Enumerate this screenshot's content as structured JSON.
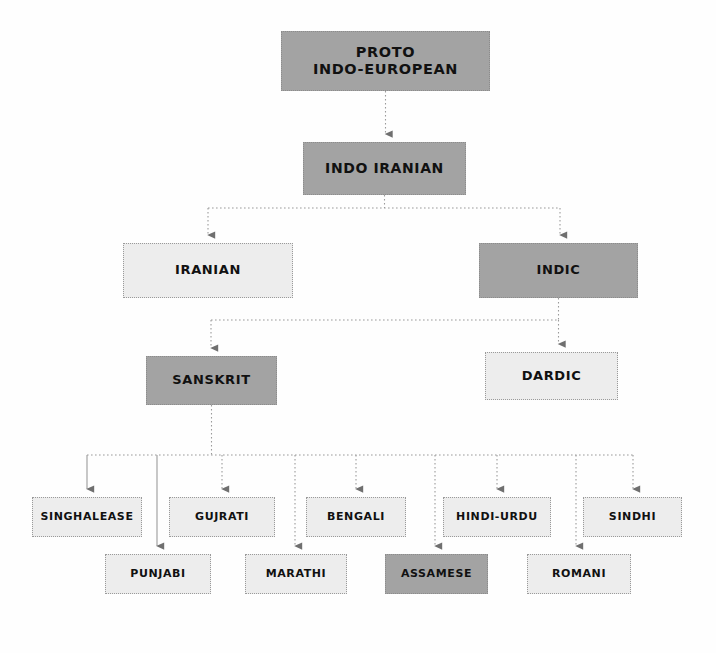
{
  "diagram": {
    "type": "tree-diagram",
    "background_color": "#fefefe",
    "colors": {
      "node_dark": "#a3a3a3",
      "node_light": "#ededed",
      "border": "#9a9a9a",
      "text": "#111111",
      "connector": "#9a9a9a"
    },
    "nodes": [
      {
        "id": "proto",
        "label": "PROTO\nINDO-EUROPEAN",
        "shade": "dark",
        "x": 281,
        "y": 31,
        "w": 209,
        "h": 60,
        "level": "root"
      },
      {
        "id": "indoiran",
        "label": "INDO IRANIAN",
        "shade": "dark",
        "x": 303,
        "y": 142,
        "w": 163,
        "h": 53,
        "level": "1"
      },
      {
        "id": "iranian",
        "label": "IRANIAN",
        "shade": "light",
        "x": 123,
        "y": 243,
        "w": 170,
        "h": 55,
        "level": "2"
      },
      {
        "id": "indic",
        "label": "INDIC",
        "shade": "dark",
        "x": 479,
        "y": 243,
        "w": 159,
        "h": 55,
        "level": "2"
      },
      {
        "id": "sanskrit",
        "label": "SANSKRIT",
        "shade": "dark",
        "x": 146,
        "y": 356,
        "w": 131,
        "h": 49,
        "level": "3"
      },
      {
        "id": "dardic",
        "label": "DARDIC",
        "shade": "light",
        "x": 485,
        "y": 352,
        "w": 133,
        "h": 48,
        "level": "3"
      },
      {
        "id": "singhalease",
        "label": "SINGHALEASE",
        "shade": "light",
        "x": 32,
        "y": 497,
        "w": 110,
        "h": 40,
        "level": "4"
      },
      {
        "id": "gujrati",
        "label": "GUJRATI",
        "shade": "light",
        "x": 169,
        "y": 497,
        "w": 106,
        "h": 40,
        "level": "4"
      },
      {
        "id": "bengali",
        "label": "BENGALI",
        "shade": "light",
        "x": 306,
        "y": 497,
        "w": 100,
        "h": 40,
        "level": "4"
      },
      {
        "id": "hindiurdu",
        "label": "HINDI-URDU",
        "shade": "light",
        "x": 443,
        "y": 497,
        "w": 108,
        "h": 40,
        "level": "4"
      },
      {
        "id": "sindhi",
        "label": "SINDHI",
        "shade": "light",
        "x": 583,
        "y": 497,
        "w": 99,
        "h": 40,
        "level": "4"
      },
      {
        "id": "punjabi",
        "label": "PUNJABI",
        "shade": "light",
        "x": 105,
        "y": 554,
        "w": 106,
        "h": 40,
        "level": "5"
      },
      {
        "id": "marathi",
        "label": "MARATHI",
        "shade": "light",
        "x": 245,
        "y": 554,
        "w": 102,
        "h": 40,
        "level": "5"
      },
      {
        "id": "assamese",
        "label": "ASSAMESE",
        "shade": "dark",
        "x": 385,
        "y": 554,
        "w": 103,
        "h": 40,
        "level": "5"
      },
      {
        "id": "romani",
        "label": "ROMANI",
        "shade": "light",
        "x": 527,
        "y": 554,
        "w": 104,
        "h": 40,
        "level": "5"
      }
    ],
    "edges": [
      {
        "from": "proto",
        "to": "indoiran",
        "style": "dotted"
      },
      {
        "from": "indoiran",
        "to": "iranian",
        "style": "dotted"
      },
      {
        "from": "indoiran",
        "to": "indic",
        "style": "dotted"
      },
      {
        "from": "indic",
        "to": "sanskrit",
        "style": "dotted"
      },
      {
        "from": "indic",
        "to": "dardic",
        "style": "dotted"
      },
      {
        "from": "sanskrit",
        "to": "singhalease",
        "style": "solid"
      },
      {
        "from": "sanskrit",
        "to": "gujrati",
        "style": "dotted"
      },
      {
        "from": "sanskrit",
        "to": "bengali",
        "style": "dotted"
      },
      {
        "from": "sanskrit",
        "to": "hindiurdu",
        "style": "dotted"
      },
      {
        "from": "sanskrit",
        "to": "sindhi",
        "style": "dotted"
      },
      {
        "from": "sanskrit",
        "to": "punjabi",
        "style": "solid"
      },
      {
        "from": "sanskrit",
        "to": "marathi",
        "style": "dotted"
      },
      {
        "from": "sanskrit",
        "to": "assamese",
        "style": "dotted"
      },
      {
        "from": "sanskrit",
        "to": "romani",
        "style": "dotted"
      }
    ]
  }
}
